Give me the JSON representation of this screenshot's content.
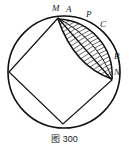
{
  "figure": {
    "caption_prefix": "图",
    "caption_number": "300",
    "caption_full": "图 300",
    "background_color": "#ffffff",
    "stroke_color": "#111111",
    "hatch_color": "#111111"
  },
  "labels": {
    "M": "M",
    "A": "A",
    "P": "P",
    "C": "C",
    "B": "B",
    "N": "N"
  },
  "geometry": {
    "circle": {
      "center_x": 64,
      "center_y": 72,
      "radius": 56
    },
    "inscribed_square_vertices": [
      {
        "name": "M",
        "x": 58,
        "y": 18
      },
      {
        "name": "N",
        "x": 112,
        "y": 80
      },
      {
        "name": "bottom",
        "x": 63,
        "y": 124
      },
      {
        "name": "left",
        "x": 9,
        "y": 72
      }
    ],
    "arc_points": [
      {
        "name": "M",
        "x": 58,
        "y": 18
      },
      {
        "name": "A",
        "x": 72,
        "y": 19
      },
      {
        "name": "P",
        "x": 90,
        "y": 26
      },
      {
        "name": "C",
        "x": 101,
        "y": 34
      },
      {
        "name": "B",
        "x": 112,
        "y": 60
      },
      {
        "name": "N",
        "x": 112,
        "y": 80
      }
    ],
    "shaded_regions": [
      {
        "name": "inner-lens",
        "description": "hatched lens between chord MN and inner arc"
      },
      {
        "name": "outer-crescent",
        "description": "hatched crescent between chord MN and circle arc M-A-P-C-B-N"
      }
    ]
  }
}
